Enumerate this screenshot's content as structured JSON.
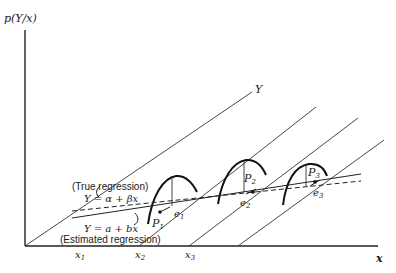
{
  "diagram": {
    "y_axis_label": "p(Y/x)",
    "x_axis_label": "x",
    "depth_axis_label": "Y",
    "x_ticks": [
      "x1",
      "x2",
      "x3"
    ],
    "x_ticks_display": {
      "x1": "x",
      "x2": "x",
      "x3": "x",
      "s1": "1",
      "s2": "2",
      "s3": "3"
    },
    "points": [
      {
        "label": "P",
        "sub": "1"
      },
      {
        "label": "P",
        "sub": "2"
      },
      {
        "label": "P",
        "sub": "3"
      }
    ],
    "errors": [
      {
        "label": "e",
        "sub": "1"
      },
      {
        "label": "e",
        "sub": "2"
      },
      {
        "label": "e",
        "sub": "3"
      }
    ],
    "true_regression": {
      "caption": "(True regression)",
      "equation": "Y = α + βx",
      "style": "dashed"
    },
    "estimated_regression": {
      "caption": "(Estimated regression)",
      "equation": "Y = a + bx",
      "style": "solid"
    }
  }
}
